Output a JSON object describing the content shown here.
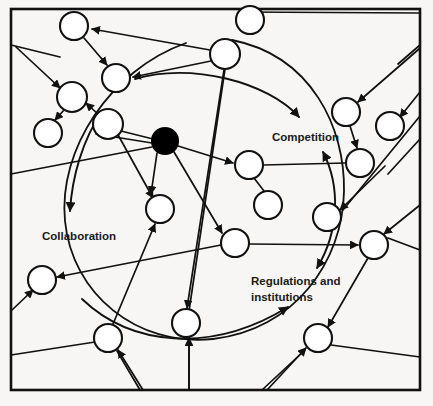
{
  "diagram": {
    "type": "node-link-network",
    "background_color": "#f7f6f4",
    "stroke_color": "#111111",
    "node_fill": "#ffffff",
    "hub_fill": "#000000",
    "frame": {
      "x": 11,
      "y": 9,
      "width": 409,
      "height": 381,
      "stroke_width": 2.6
    },
    "labels": [
      {
        "id": "competition",
        "text": "Competition",
        "x": 272,
        "y": 136,
        "font_size": 11.5,
        "lines": [
          "Competition"
        ]
      },
      {
        "id": "collaboration",
        "text": "Collaboration",
        "x": 42,
        "y": 236,
        "font_size": 11.5,
        "lines": [
          "Collaboration"
        ]
      },
      {
        "id": "regulations-and-institutions",
        "text": "Regulations and institutions",
        "x": 251,
        "y": 283,
        "font_size": 11.5,
        "lines": [
          "Regulations and",
          "institutions"
        ]
      }
    ],
    "hub_node": {
      "id": "hub",
      "cx": 165,
      "cy": 141,
      "r": 13,
      "filled": true
    },
    "nodes": [
      {
        "id": "n1",
        "cx": 74,
        "cy": 26,
        "r": 14
      },
      {
        "id": "n2",
        "cx": 250,
        "cy": 20,
        "r": 14
      },
      {
        "id": "n3",
        "cx": 225,
        "cy": 54,
        "r": 15
      },
      {
        "id": "n4",
        "cx": 116,
        "cy": 78,
        "r": 14
      },
      {
        "id": "n5",
        "cx": 72,
        "cy": 97,
        "r": 15
      },
      {
        "id": "n6",
        "cx": 48,
        "cy": 133,
        "r": 14
      },
      {
        "id": "n7",
        "cx": 108,
        "cy": 124,
        "r": 15
      },
      {
        "id": "n8",
        "cx": 346,
        "cy": 112,
        "r": 14
      },
      {
        "id": "n9",
        "cx": 390,
        "cy": 126,
        "r": 14
      },
      {
        "id": "n10",
        "cx": 360,
        "cy": 163,
        "r": 14
      },
      {
        "id": "n11",
        "cx": 249,
        "cy": 165,
        "r": 14
      },
      {
        "id": "n12",
        "cx": 268,
        "cy": 205,
        "r": 14
      },
      {
        "id": "n13",
        "cx": 160,
        "cy": 209,
        "r": 14
      },
      {
        "id": "n14",
        "cx": 235,
        "cy": 243,
        "r": 14
      },
      {
        "id": "n15",
        "cx": 327,
        "cy": 217,
        "r": 14
      },
      {
        "id": "n16",
        "cx": 374,
        "cy": 245,
        "r": 14
      },
      {
        "id": "n17",
        "cx": 42,
        "cy": 280,
        "r": 14
      },
      {
        "id": "n18",
        "cx": 186,
        "cy": 323,
        "r": 14
      },
      {
        "id": "n19",
        "cx": 108,
        "cy": 338,
        "r": 14
      },
      {
        "id": "n20",
        "cx": 318,
        "cy": 338,
        "r": 14
      }
    ],
    "orbit_arc": {
      "cx": 205,
      "cy": 190,
      "rx": 140,
      "ry": 152,
      "stroke_width": 1.8,
      "description": "large open circle enclosing the hub"
    },
    "edges_straight": [
      {
        "from": "n3",
        "to": "n1",
        "arrow": "to"
      },
      {
        "from": "n3",
        "to": "n4",
        "arrow": "to"
      },
      {
        "from": "n1",
        "to": "n4",
        "arrow": "to"
      },
      {
        "from": "n5",
        "to": "n6",
        "arrow": "to"
      },
      {
        "from": "n7",
        "to": "n5",
        "arrow": "to"
      },
      {
        "from": "hub",
        "to": "n11",
        "arrow": "to"
      },
      {
        "from": "hub",
        "to": "n13",
        "arrow": "to"
      },
      {
        "from": "hub",
        "to": "n14",
        "arrow": "to"
      },
      {
        "from": "n11",
        "to": "n10",
        "arrow": "none"
      },
      {
        "from": "n11",
        "to": "n12",
        "arrow": "none"
      },
      {
        "from": "n8",
        "to": "n10",
        "arrow": "to"
      },
      {
        "from": "n14",
        "to": "n16",
        "arrow": "to"
      },
      {
        "from": "n16",
        "to": "n20",
        "arrow": "to"
      },
      {
        "from": "n19",
        "to": "n17",
        "arrow": "to"
      },
      {
        "from": "n19",
        "to": "n13",
        "arrow": "to"
      },
      {
        "from": "n3",
        "to": "n18",
        "arrow": "to"
      },
      {
        "from": "n7",
        "to": "n13",
        "arrow": "to"
      },
      {
        "from": "n15",
        "to": "n16",
        "arrow": "none"
      }
    ],
    "curved_label_arrows": [
      {
        "target": "competition",
        "direction": "right",
        "arrow": "to"
      },
      {
        "target": "collaboration",
        "direction": "down",
        "arrow": "to"
      },
      {
        "target": "regulations-and-institutions",
        "direction": "up-right",
        "arrow": "to"
      },
      {
        "target": "competition-vertical",
        "direction": "vertical",
        "arrow": "both"
      }
    ]
  }
}
